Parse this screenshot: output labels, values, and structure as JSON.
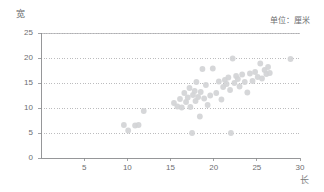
{
  "chart_data": {
    "type": "scatter",
    "title": "",
    "xlabel": "长",
    "ylabel": "宽",
    "unit_note": "单位：厘米",
    "xlim": [
      0,
      30
    ],
    "ylim": [
      0,
      25
    ],
    "xticks": [
      5,
      10,
      15,
      20,
      25,
      30
    ],
    "yticks": [
      0,
      5,
      10,
      15,
      20,
      25
    ],
    "grid": "horizontal-dotted",
    "legend": "none",
    "marker_color": "#d3d4d6",
    "axis_color": "#8b8c8e",
    "grid_color": "#9fa0a2",
    "points": [
      [
        9.6,
        6.6
      ],
      [
        10.1,
        5.5
      ],
      [
        10.9,
        6.5
      ],
      [
        11.3,
        6.6
      ],
      [
        11.9,
        9.4
      ],
      [
        15.4,
        11.0
      ],
      [
        15.8,
        10.3
      ],
      [
        16.1,
        11.8
      ],
      [
        16.3,
        10.1
      ],
      [
        16.6,
        13.0
      ],
      [
        16.8,
        11.2
      ],
      [
        17.0,
        12.1
      ],
      [
        17.2,
        14.0
      ],
      [
        17.3,
        10.2
      ],
      [
        17.5,
        5.0
      ],
      [
        17.6,
        12.6
      ],
      [
        17.8,
        13.4
      ],
      [
        17.9,
        11.4
      ],
      [
        18.0,
        15.2
      ],
      [
        18.2,
        12.2
      ],
      [
        18.4,
        8.3
      ],
      [
        18.5,
        13.2
      ],
      [
        18.7,
        17.8
      ],
      [
        18.9,
        11.9
      ],
      [
        19.1,
        14.6
      ],
      [
        19.3,
        10.6
      ],
      [
        19.6,
        12.5
      ],
      [
        19.9,
        17.9
      ],
      [
        20.3,
        13.0
      ],
      [
        20.6,
        15.3
      ],
      [
        20.9,
        11.7
      ],
      [
        21.1,
        14.2
      ],
      [
        21.3,
        15.6
      ],
      [
        21.5,
        14.8
      ],
      [
        21.7,
        16.1
      ],
      [
        21.9,
        13.6
      ],
      [
        22.0,
        5.0
      ],
      [
        22.2,
        19.9
      ],
      [
        22.4,
        15.0
      ],
      [
        22.6,
        16.4
      ],
      [
        22.8,
        15.8
      ],
      [
        23.0,
        14.3
      ],
      [
        23.3,
        16.7
      ],
      [
        23.6,
        15.2
      ],
      [
        23.9,
        13.1
      ],
      [
        24.2,
        16.9
      ],
      [
        24.5,
        15.4
      ],
      [
        24.8,
        17.2
      ],
      [
        25.1,
        16.2
      ],
      [
        25.4,
        18.9
      ],
      [
        25.6,
        15.9
      ],
      [
        25.9,
        17.6
      ],
      [
        26.1,
        16.8
      ],
      [
        26.3,
        18.2
      ],
      [
        26.5,
        17.0
      ],
      [
        28.9,
        19.8
      ]
    ]
  },
  "axis": {
    "y_title": "宽",
    "x_title": "长",
    "unit_note": "单位：厘米",
    "y_tick_labels": [
      "25",
      "20",
      "15",
      "10",
      "5",
      "0"
    ],
    "x_tick_labels": [
      "5",
      "10",
      "15",
      "20",
      "25",
      "30"
    ]
  }
}
